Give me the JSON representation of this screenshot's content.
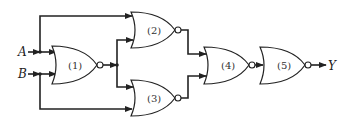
{
  "diagram": {
    "type": "logic-circuit",
    "inputs": [
      {
        "label": "A"
      },
      {
        "label": "B"
      }
    ],
    "output": {
      "label": "Y"
    },
    "gates": [
      {
        "id": "1",
        "label": "(1)",
        "type": "NOR",
        "inputs": [
          "A",
          "B"
        ]
      },
      {
        "id": "2",
        "label": "(2)",
        "type": "NOR",
        "inputs": [
          "A",
          "1"
        ]
      },
      {
        "id": "3",
        "label": "(3)",
        "type": "NOR",
        "inputs": [
          "1",
          "B"
        ]
      },
      {
        "id": "4",
        "label": "(4)",
        "type": "NOR",
        "inputs": [
          "2",
          "3"
        ]
      },
      {
        "id": "5",
        "label": "(5)",
        "type": "NOR",
        "inputs": [
          "4"
        ]
      }
    ],
    "colors": {
      "line": "#222222",
      "background": "#ffffff"
    }
  }
}
